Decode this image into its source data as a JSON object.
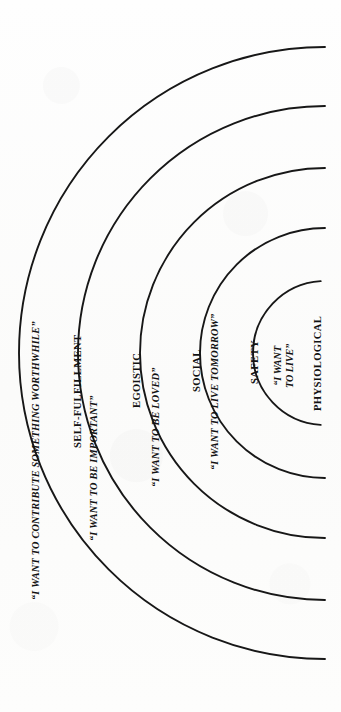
{
  "figure": {
    "orientation": "sideways",
    "background_color": "#fdfdfc",
    "line_color": "#171717",
    "text_color": "#121212"
  },
  "geometry": {
    "center_x": 325,
    "center_y": 353,
    "radii": [
      306,
      247,
      185,
      125,
      72
    ],
    "stroke_width": 1.9
  },
  "tiers": [
    {
      "index": 1,
      "name": "PHYSIOLOGICAL",
      "quote_line_1": "“I WANT",
      "quote_line_2": "TO LIVE”",
      "quote": "“I WANT TO LIVE”",
      "radius": 72
    },
    {
      "index": 2,
      "name": "SAFETY",
      "quote": "“I WANT TO LIVE TOMORROW”",
      "radius": 125
    },
    {
      "index": 3,
      "name": "SOCIAL",
      "quote": "“I WANT TO BE LOVED”",
      "radius": 185
    },
    {
      "index": 4,
      "name": "EGOISTIC",
      "quote": "“I WANT TO BE IMPORTANT”",
      "radius": 247
    },
    {
      "index": 5,
      "name": "SELF-FULFILLMENT",
      "quote": "“I WANT TO CONTRIBUTE SOMETHING WORTHWHILE”",
      "radius": 306
    }
  ]
}
